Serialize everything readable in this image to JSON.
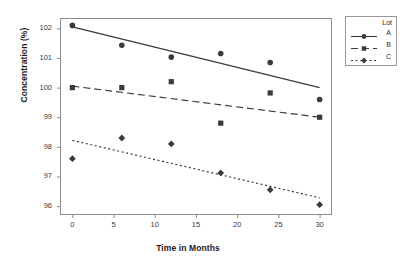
{
  "chart_data": {
    "type": "scatter",
    "title": "",
    "xlabel": "Time in Months",
    "ylabel": "Concentration (%)",
    "xlim": [
      -1.5,
      31.5
    ],
    "ylim": [
      95.7,
      102.35
    ],
    "xticks": [
      0,
      5,
      10,
      15,
      20,
      25,
      30
    ],
    "xticklabels": [
      "0",
      "5",
      "10",
      "15",
      "20",
      "25",
      "30"
    ],
    "yticks": [
      96,
      97,
      98,
      99,
      100,
      101,
      102
    ],
    "yticklabels": [
      "96",
      "97",
      "98",
      "99",
      "100",
      "101",
      "102"
    ],
    "grid": false,
    "legend": {
      "title": "Lot",
      "position": "right",
      "entries": [
        "A",
        "B",
        "C"
      ]
    },
    "series": [
      {
        "name": "A",
        "marker": "circle",
        "linestyle": "solid",
        "color": "#3a3a3a",
        "x": [
          0,
          6,
          12,
          18,
          24,
          30
        ],
        "y": [
          102.1,
          101.43,
          101.03,
          101.15,
          100.85,
          99.6
        ],
        "fit_line": {
          "x": [
            0,
            30
          ],
          "y": [
            102.05,
            100.0
          ]
        }
      },
      {
        "name": "B",
        "marker": "square",
        "linestyle": "dashed",
        "color": "#3a3a3a",
        "x": [
          0,
          6,
          12,
          18,
          24,
          30
        ],
        "y": [
          100.0,
          100.0,
          100.2,
          98.8,
          99.82,
          99.0
        ],
        "fit_line": {
          "x": [
            0,
            30
          ],
          "y": [
            100.05,
            99.0
          ]
        }
      },
      {
        "name": "C",
        "marker": "diamond",
        "linestyle": "dotted",
        "color": "#3a3a3a",
        "x": [
          0,
          6,
          12,
          18,
          24,
          30
        ],
        "y": [
          97.6,
          98.3,
          98.1,
          97.12,
          96.55,
          96.05
        ],
        "fit_line": {
          "x": [
            0,
            30
          ],
          "y": [
            98.22,
            96.28
          ]
        }
      }
    ]
  },
  "plot_area": {
    "left": 60,
    "right": 332,
    "top": 18,
    "bottom": 215,
    "border_color": "#8c8c8c",
    "background": "#ffffff"
  }
}
